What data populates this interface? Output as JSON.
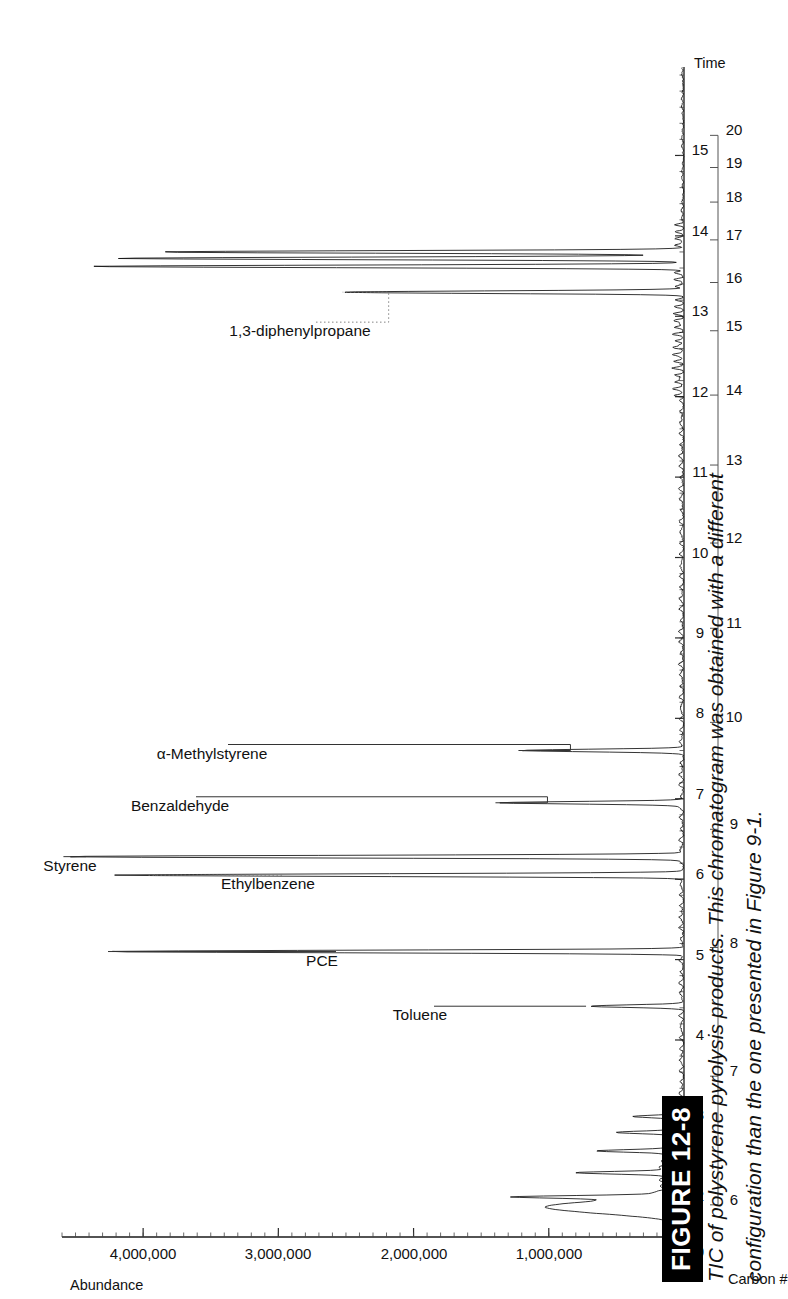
{
  "figure": {
    "tag": "FIGURE 12-8",
    "caption_line1": "TIC of polystyrene pyrolysis products. This chromatogram was obtained with a different",
    "caption_line2": "configuration than the one presented in Figure 9-1."
  },
  "chart_data": {
    "type": "line",
    "title": "",
    "xlabel": "Time",
    "secondary_xlabel": "Carbon #",
    "ylabel": "Abundance",
    "xlim": [
      1.55,
      16.1
    ],
    "ylim": [
      0,
      4600000
    ],
    "grid": false,
    "legend": "none",
    "y_ticks": [
      0,
      1000000,
      2000000,
      3000000,
      4000000
    ],
    "y_tick_labels": [
      "0",
      "1,000,000",
      "2,000,000",
      "3,000,000",
      "4,000,000"
    ],
    "x_ticks": [
      2,
      3,
      4,
      5,
      6,
      7,
      8,
      9,
      10,
      11,
      12,
      13,
      14,
      15
    ],
    "x_tick_labels": [
      "2",
      "3",
      "4",
      "5",
      "6",
      "7",
      "8",
      "9",
      "10",
      "11",
      "12",
      "13",
      "14",
      "15"
    ],
    "carbon_ticks": [
      6,
      7,
      8,
      9,
      10,
      11,
      12,
      13,
      14,
      15,
      16,
      17,
      18,
      19,
      20
    ],
    "carbon_tick_labels": [
      "6",
      "7",
      "8",
      "9",
      "10",
      "11",
      "12",
      "13",
      "14",
      "15",
      "16",
      "17",
      "18",
      "19",
      "20"
    ],
    "carbon_time_map": [
      {
        "carbon": 6,
        "time": 1.95
      },
      {
        "carbon": 7,
        "time": 3.55
      },
      {
        "carbon": 8,
        "time": 5.15
      },
      {
        "carbon": 9,
        "time": 6.62
      },
      {
        "carbon": 10,
        "time": 7.95
      },
      {
        "carbon": 11,
        "time": 9.12
      },
      {
        "carbon": 12,
        "time": 10.18
      },
      {
        "carbon": 13,
        "time": 11.15
      },
      {
        "carbon": 14,
        "time": 12.02
      },
      {
        "carbon": 15,
        "time": 12.82
      },
      {
        "carbon": 16,
        "time": 13.42
      },
      {
        "carbon": 17,
        "time": 13.95
      },
      {
        "carbon": 18,
        "time": 14.42
      },
      {
        "carbon": 19,
        "time": 14.85
      },
      {
        "carbon": 20,
        "time": 15.25
      }
    ],
    "peaks": [
      {
        "label": "Toluene",
        "time": 4.42,
        "abundance": 680000
      },
      {
        "label": "PCE",
        "time": 5.1,
        "abundance": 4230000
      },
      {
        "label": "Styrene",
        "time": 6.28,
        "abundance": 4560000
      },
      {
        "label": "Ethylbenzene",
        "time": 6.05,
        "abundance": 4200000
      },
      {
        "label": "Benzaldehyde",
        "time": 6.95,
        "abundance": 1350000
      },
      {
        "label": "α-Methylstyrene",
        "time": 7.6,
        "abundance": 1180000
      },
      {
        "label": "1,3-diphenylpropane",
        "time": 13.3,
        "abundance": 2480000
      }
    ],
    "unlabeled_peaks": [
      {
        "time": 13.62,
        "abundance": 4340000
      },
      {
        "time": 13.72,
        "abundance": 4150000
      },
      {
        "time": 13.8,
        "abundance": 3800000
      },
      {
        "time": 2.05,
        "abundance": 900000
      },
      {
        "time": 2.35,
        "abundance": 620000
      },
      {
        "time": 2.62,
        "abundance": 540000
      },
      {
        "time": 2.85,
        "abundance": 430000
      },
      {
        "time": 3.05,
        "abundance": 330000
      }
    ],
    "peak_labels_order": [
      "Styrene",
      "PCE",
      "Toluene",
      "Ethylbenzene",
      "Benzaldehyde",
      "α-Methylstyrene",
      "1,3-diphenylpropane"
    ]
  },
  "axes": {
    "y_axis_title": "Abundance",
    "x_axis_title": "Time",
    "carbon_axis_title": "Carbon #"
  }
}
